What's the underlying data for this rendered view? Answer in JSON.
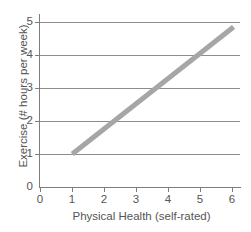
{
  "chart_data": {
    "type": "line",
    "title": "",
    "xlabel": "Physical Health (self-rated)",
    "ylabel": "Exercise (# hours per week)",
    "xlim": [
      0,
      6.2
    ],
    "ylim": [
      0,
      5
    ],
    "xticks": [
      0,
      1,
      2,
      3,
      4,
      5,
      6
    ],
    "xtick_labels": [
      "0",
      "1",
      "2",
      "3",
      "4",
      "5",
      "6"
    ],
    "yticks": [
      0,
      1,
      2,
      3,
      4,
      5
    ],
    "ytick_labels": [
      "0",
      "1",
      "2",
      "3",
      "4",
      "5"
    ],
    "grid": "horizontal",
    "legend": "none",
    "series": [
      {
        "name": "trend",
        "style": "thick-line",
        "color": "#a6a6a6",
        "linewidth": 5,
        "x": [
          1,
          6
        ],
        "y": [
          1,
          4.85
        ],
        "points": [
          {
            "x": 1,
            "y": 1
          },
          {
            "x": 2.2,
            "y": 2
          },
          {
            "x": 3.5,
            "y": 3
          },
          {
            "x": 4.8,
            "y": 4
          },
          {
            "x": 6,
            "y": 4.85
          }
        ]
      }
    ],
    "colors": {
      "background": "#ffffff",
      "axis": "#7d7d7d",
      "gridline": "#8d8d8d",
      "text": "#555555",
      "trend": "#a6a6a6"
    }
  }
}
